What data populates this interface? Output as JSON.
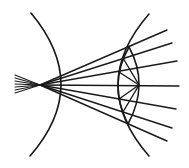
{
  "diagram": {
    "stroke_color": "#1a1a1a",
    "background": "#ffffff",
    "focal_point": {
      "x": 40,
      "y": 85
    },
    "left_surface": {
      "top": [
        31,
        13
      ],
      "apex": [
        61,
        85
      ],
      "bottom": [
        30,
        156
      ]
    },
    "right_surface": {
      "top": [
        149,
        14
      ],
      "apex": [
        118,
        85
      ],
      "bottom": [
        149,
        156
      ]
    },
    "inner_lens": {
      "top": [
        129,
        47
      ],
      "left": [
        118,
        85
      ],
      "right": [
        139,
        85
      ],
      "bottom": [
        128,
        124
      ]
    },
    "incoming_fan": [
      {
        "from": [
          15,
          75
        ],
        "to": [
          40,
          85
        ]
      },
      {
        "from": [
          15,
          78
        ],
        "to": [
          40,
          85
        ]
      },
      {
        "from": [
          15,
          81
        ],
        "to": [
          40,
          85
        ]
      },
      {
        "from": [
          15,
          84
        ],
        "to": [
          40,
          85
        ]
      },
      {
        "from": [
          15,
          87
        ],
        "to": [
          40,
          85
        ]
      },
      {
        "from": [
          15,
          90
        ],
        "to": [
          40,
          85
        ]
      },
      {
        "from": [
          15,
          93
        ],
        "to": [
          40,
          85
        ]
      }
    ],
    "outgoing_rays": [
      {
        "from": [
          40,
          85
        ],
        "to": [
          167,
          30
        ]
      },
      {
        "from": [
          40,
          85
        ],
        "to": [
          172,
          43
        ]
      },
      {
        "from": [
          40,
          85
        ],
        "to": [
          177,
          61
        ]
      },
      {
        "from": [
          40,
          85
        ],
        "to": [
          179,
          86
        ]
      },
      {
        "from": [
          40,
          85
        ],
        "to": [
          176,
          109
        ]
      },
      {
        "from": [
          40,
          85
        ],
        "to": [
          172,
          128
        ]
      },
      {
        "from": [
          40,
          85
        ],
        "to": [
          167,
          141
        ]
      }
    ],
    "lens_chords": [
      {
        "from": [
          139,
          85
        ],
        "to": [
          123,
          58
        ]
      },
      {
        "from": [
          139,
          85
        ],
        "to": [
          119,
          72
        ]
      },
      {
        "from": [
          139,
          85
        ],
        "to": [
          119,
          99
        ]
      },
      {
        "from": [
          139,
          85
        ],
        "to": [
          123,
          112
        ]
      }
    ]
  }
}
